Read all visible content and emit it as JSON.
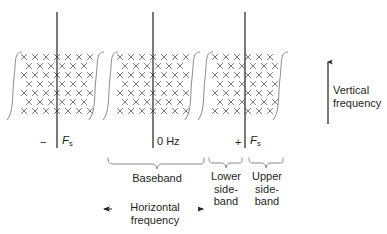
{
  "figure": {
    "title_present": false,
    "background": "#ffffff",
    "ink": "#231f20",
    "blocks": [
      {
        "id": "negative-fs-block",
        "center_label_minus": "−",
        "center_label_f": "F",
        "center_label_sub": "s",
        "cx": 66,
        "left": 14,
        "right": 118
      },
      {
        "id": "baseband-block",
        "center_label": "0 Hz",
        "cx": 156,
        "left": 104,
        "right": 208
      },
      {
        "id": "positive-fs-block",
        "center_label_plus": "+",
        "center_label_f": "F",
        "center_label_sub": "s",
        "cx": 246,
        "left": 206,
        "right": 298
      }
    ],
    "braces": [
      {
        "id": "baseband-brace",
        "label": "Baseband",
        "x1": 108,
        "x2": 206,
        "label_x": 157
      },
      {
        "id": "lower-sideband-brace",
        "label_lines": [
          "Lower",
          "side-",
          "band"
        ],
        "x1": 208,
        "x2": 245,
        "label_x": 226
      },
      {
        "id": "upper-sideband-brace",
        "label_lines": [
          "Upper",
          "side-",
          "band"
        ],
        "x1": 247,
        "x2": 288,
        "label_x": 267
      }
    ],
    "axes": [
      {
        "id": "vertical-frequency-axis",
        "label_lines": [
          "Vertical",
          "frequency"
        ],
        "direction": "up"
      },
      {
        "id": "horizontal-frequency-axis",
        "label_lines": [
          "Horizontal",
          "frequency"
        ],
        "direction": "both"
      }
    ],
    "grid": {
      "marker": "×",
      "rows": 7,
      "cols_per_half": 4,
      "description": "staggered lattice of x markers"
    }
  }
}
